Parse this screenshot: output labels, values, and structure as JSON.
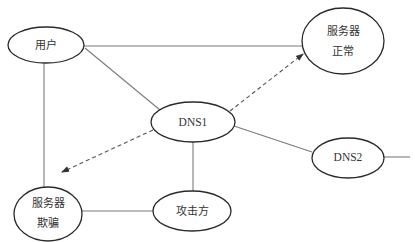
{
  "diagram": {
    "type": "network-dns-spoofing",
    "nodes": {
      "user": {
        "line1": "用户"
      },
      "server_normal": {
        "line1": "服务器",
        "line2": "正常"
      },
      "dns1": {
        "line1": "DNS1"
      },
      "dns2": {
        "line1": "DNS2"
      },
      "server_spoof": {
        "line1": "服务器",
        "line2": "欺骗"
      },
      "attacker": {
        "line1": "攻击方"
      }
    },
    "edges": [
      {
        "from": "用户",
        "to": "服务器正常",
        "style": "solid"
      },
      {
        "from": "用户",
        "to": "DNS1",
        "style": "solid"
      },
      {
        "from": "用户",
        "to": "服务器欺骗",
        "style": "solid"
      },
      {
        "from": "DNS1",
        "to": "服务器正常",
        "style": "dashed-arrow"
      },
      {
        "from": "DNS1",
        "to": "服务器欺骗",
        "style": "dashed-arrow"
      },
      {
        "from": "DNS1",
        "to": "DNS2",
        "style": "solid"
      },
      {
        "from": "DNS1",
        "to": "攻击方",
        "style": "solid"
      },
      {
        "from": "服务器欺骗",
        "to": "攻击方",
        "style": "solid"
      },
      {
        "from": "DNS2",
        "to": "off-canvas",
        "style": "solid"
      }
    ],
    "colors": {
      "node_stroke": "#2a2a2a",
      "edge": "#7a7a7a",
      "text": "#333333",
      "background": "#ffffff"
    }
  }
}
